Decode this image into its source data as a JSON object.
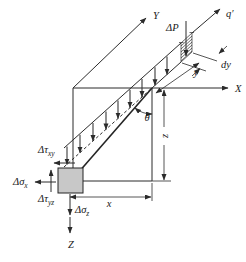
{
  "figure": {
    "kind": "line-load-on-semi-infinite-mass stress diagram"
  },
  "colors": {
    "line": "#2b2b2b",
    "load_arrow": "#3a3a3a",
    "element_fill": "#c8c8c8",
    "background": "#ffffff"
  },
  "axes": {
    "x_label": "X",
    "y_label": "Y",
    "z_label": "Z"
  },
  "load": {
    "resultant": "ΔP",
    "intensity": "q′"
  },
  "dims": {
    "x": "x",
    "y": "y",
    "z": "z",
    "dy": "dy",
    "theta": "θ"
  },
  "stresses": {
    "tau_xy": {
      "base": "Δτ",
      "sub": "xy"
    },
    "sigma_x": {
      "base": "Δσ",
      "sub": "x"
    },
    "tau_yz": {
      "base": "Δτ",
      "sub": "yz"
    },
    "sigma_z": {
      "base": "Δσ",
      "sub": "z"
    }
  }
}
